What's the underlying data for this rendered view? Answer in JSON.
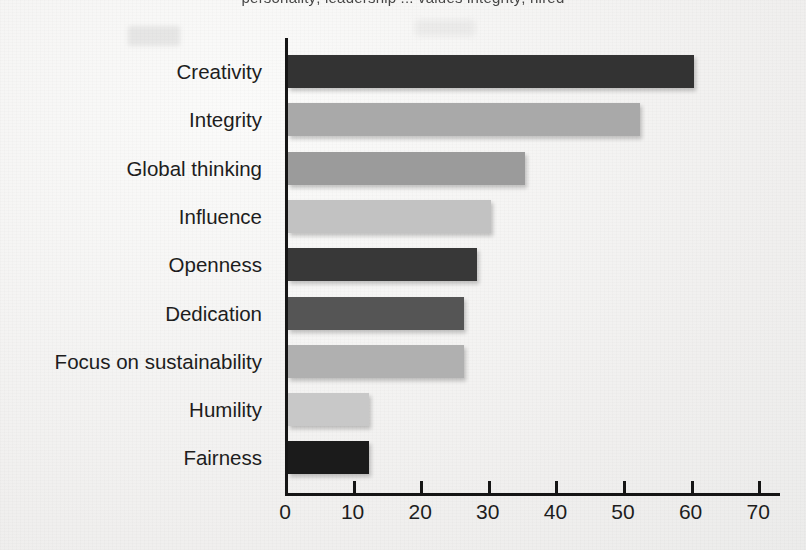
{
  "cropped_heading_fragment": "personality; leadership ... values integrity; hired",
  "chart_data": {
    "type": "bar",
    "orientation": "horizontal",
    "title": "",
    "subtitle": "",
    "xlabel": "",
    "ylabel": "",
    "categories": [
      "Creativity",
      "Integrity",
      "Global thinking",
      "Influence",
      "Openness",
      "Dedication",
      "Focus on sustainability",
      "Humility",
      "Fairness"
    ],
    "values": [
      60,
      52,
      35,
      30,
      28,
      26,
      26,
      12,
      12
    ],
    "bar_colors": [
      "#333333",
      "#a9a9a9",
      "#9b9b9b",
      "#c2c2c2",
      "#383838",
      "#555555",
      "#b0b0b0",
      "#c8c8c8",
      "#1b1b1b"
    ],
    "xticks": [
      0,
      10,
      20,
      30,
      40,
      50,
      60,
      70
    ],
    "xticklabels": [
      "0",
      "10",
      "20",
      "30",
      "40",
      "50",
      "60",
      "70"
    ],
    "xlim": [
      0,
      73
    ],
    "grid": false,
    "legend": false,
    "legend_position": "none",
    "axis_color": "#151515",
    "background_color": "#f2f2f1"
  }
}
